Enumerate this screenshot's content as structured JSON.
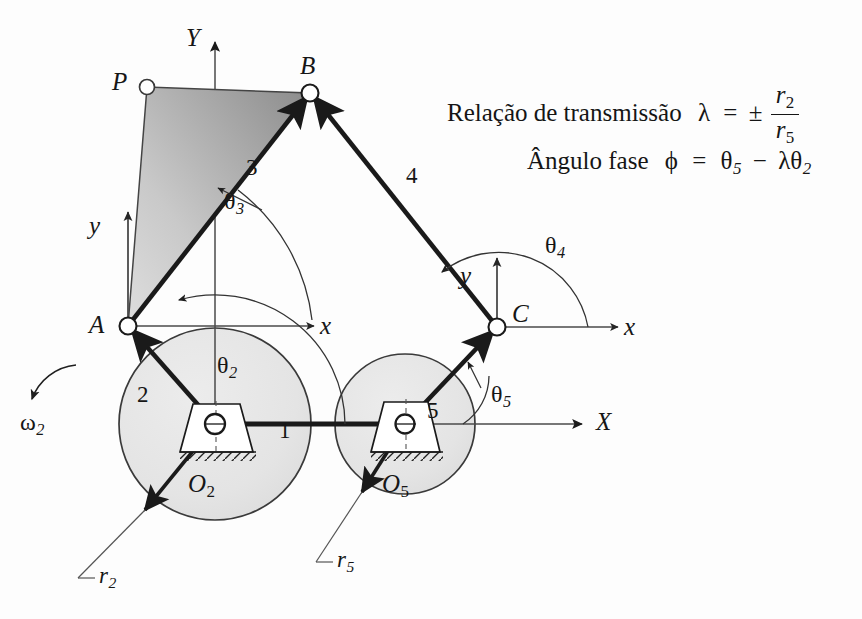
{
  "diagram": {
    "points": {
      "P": "P",
      "A": "A",
      "B": "B",
      "C": "C",
      "O2": "O",
      "O2_sub": "2",
      "O5": "O",
      "O5_sub": "5"
    },
    "global_axes": {
      "x": "X",
      "y": "Y"
    },
    "local_axes": {
      "a_x": "x",
      "a_y": "y",
      "c_x": "x",
      "c_y": "y"
    },
    "links": [
      {
        "id": "link-1",
        "label": "1"
      },
      {
        "id": "link-2",
        "label": "2"
      },
      {
        "id": "link-3",
        "label": "3"
      },
      {
        "id": "link-4",
        "label": "4"
      },
      {
        "id": "link-5",
        "label": "5"
      }
    ],
    "angles": [
      {
        "id": "theta-2",
        "symbol": "θ",
        "sub": "2"
      },
      {
        "id": "theta-3",
        "symbol": "θ",
        "sub": "3"
      },
      {
        "id": "theta-4",
        "symbol": "θ",
        "sub": "4"
      },
      {
        "id": "theta-5",
        "symbol": "θ",
        "sub": "5"
      }
    ],
    "omega": {
      "symbol": "ω",
      "sub": "2"
    },
    "radii": [
      {
        "id": "r2",
        "symbol": "r",
        "sub": "2"
      },
      {
        "id": "r5",
        "symbol": "r",
        "sub": "5"
      }
    ],
    "formulas": {
      "ratio_label": "Relação de transmissão",
      "ratio_symbol": "λ",
      "ratio_equals": "=",
      "ratio_pm": "±",
      "ratio_num": "r",
      "ratio_num_sub": "2",
      "ratio_den": "r",
      "ratio_den_sub": "5",
      "phase_label": "Ângulo fase",
      "phase_symbol": "ϕ",
      "phase_equals": "=",
      "phase_theta5": "θ",
      "phase_theta5_sub": "5",
      "phase_minus": "−",
      "phase_lambda": "λ",
      "phase_theta2": "θ",
      "phase_theta2_sub": "2"
    },
    "colors": {
      "line": "#1a1a1a",
      "thin_line": "#4a4a4a",
      "circle_fill": "#e6e6e6",
      "circle_stroke": "#333333",
      "coupler_light": "#d8d8d8",
      "coupler_dark": "#8d8d8d",
      "background": "#fdfdfd"
    }
  }
}
